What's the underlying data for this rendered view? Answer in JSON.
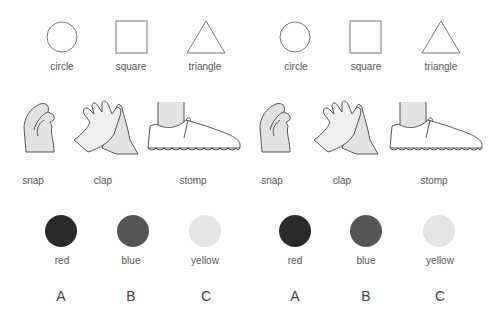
{
  "panels": [
    {
      "shapes": [
        {
          "label": "circle",
          "icon": "circle-icon"
        },
        {
          "label": "square",
          "icon": "square-icon"
        },
        {
          "label": "triangle",
          "icon": "triangle-icon"
        }
      ],
      "actions": [
        {
          "label": "snap",
          "icon": "snap-hand-icon"
        },
        {
          "label": "clap",
          "icon": "clap-hands-icon"
        },
        {
          "label": "stomp",
          "icon": "stomp-shoe-icon"
        }
      ],
      "colors": [
        {
          "label": "red",
          "swatch": "#2a2a2a"
        },
        {
          "label": "blue",
          "swatch": "#555555"
        },
        {
          "label": "yellow",
          "swatch": "#e4e4e4"
        }
      ],
      "letters": [
        "A",
        "B",
        "C"
      ]
    },
    {
      "shapes": [
        {
          "label": "circle",
          "icon": "circle-icon"
        },
        {
          "label": "square",
          "icon": "square-icon"
        },
        {
          "label": "triangle",
          "icon": "triangle-icon"
        }
      ],
      "actions": [
        {
          "label": "snap",
          "icon": "snap-hand-icon"
        },
        {
          "label": "clap",
          "icon": "clap-hands-icon"
        },
        {
          "label": "stomp",
          "icon": "stomp-shoe-icon"
        }
      ],
      "colors": [
        {
          "label": "red",
          "swatch": "#2a2a2a"
        },
        {
          "label": "blue",
          "swatch": "#555555"
        },
        {
          "label": "yellow",
          "swatch": "#e4e4e4"
        }
      ],
      "letters": [
        "A",
        "B",
        "C"
      ]
    }
  ]
}
